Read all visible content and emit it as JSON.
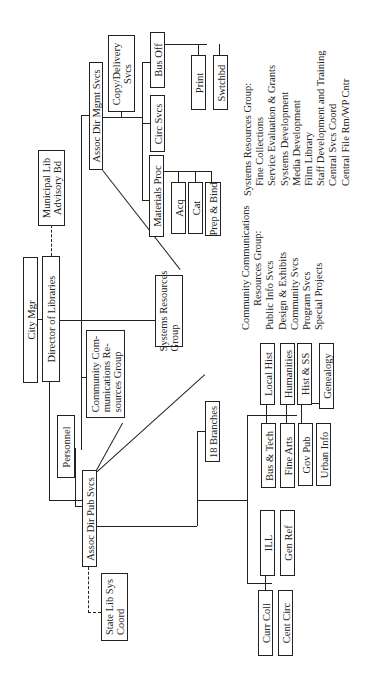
{
  "chart": {
    "orientation": "rotated -90deg (text reads bottom-to-top)",
    "nodes": {
      "city_mgr": "City Mgr",
      "director": "Director of Libraries",
      "advisory_bd_1": "Municipal Lib",
      "advisory_bd_2": "Advisory Bd",
      "personnel": "Personnel",
      "ccrg_1": "Community Com-",
      "ccrg_2": "munications Re-",
      "ccrg_3": "sources Group",
      "srg_1": "Systems Resources",
      "srg_2": "Group",
      "assoc_mgmt": "Assoc Dir Mgmt Svcs",
      "copy_1": "Copy/Delivery",
      "copy_2": "Svcs",
      "bus_off": "Bus Off",
      "circ_svcs": "Circ Svcs",
      "materials_proc": "Materials Proc",
      "acq": "Acq",
      "cat": "Cat",
      "prep_bind": "Prep & Bind",
      "print": "Print",
      "swtchbd": "Swtchbd",
      "assoc_pub": "Assoc Dir Pub Svcs",
      "state_1": "State Lib Sys",
      "state_2": "Coord",
      "branches": "18 Branches",
      "curr_coll": "Curr Coll",
      "cent_circ": "Cent Circ",
      "ill": "ILL",
      "gen_ref": "Gen Ref",
      "bus_tech": "Bus & Tech",
      "fine_arts": "Fine Arts",
      "gov_pub": "Gov Pub",
      "urban_info": "Urban Info",
      "local_hist": "Local Hist",
      "humanities": "Humanities",
      "hist_ss": "Hist & SS",
      "genealogy": "Genealogy"
    },
    "legend_ccrg": {
      "title_1": "Community Communications",
      "title_2": "Resources Group:",
      "items": [
        "Public Info Svcs",
        "Design & Exhibits",
        "Community Svcs",
        "Program Svcs",
        "Special Projects"
      ]
    },
    "legend_srg": {
      "title": "Systems Resources Group:",
      "items": [
        "Fine Collections",
        "Service Evaluation & Grants",
        "Systems Development",
        "Media Development",
        "Film Library",
        "Staff Development and Training",
        "Central Svcs Coord",
        "Central File Rm/WP Cntr"
      ]
    }
  }
}
